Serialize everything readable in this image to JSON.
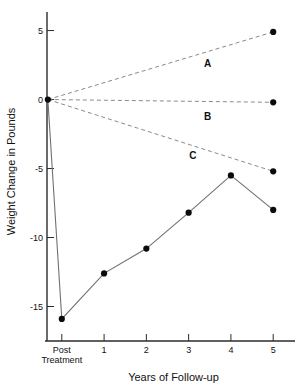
{
  "chart_data": {
    "type": "line",
    "title": "",
    "xlabel": "Years of Follow-up",
    "ylabel": "Weight Change in Pounds",
    "x": [
      0,
      1,
      2,
      3,
      4,
      5
    ],
    "xtick_labels": [
      "Post Treatment",
      "1",
      "2",
      "3",
      "4",
      "5"
    ],
    "xtick_label_lines": [
      [
        "Post",
        "Treatment"
      ],
      [
        "1"
      ],
      [
        "2"
      ],
      [
        "3"
      ],
      [
        "4"
      ],
      [
        "5"
      ]
    ],
    "ytick_labels": [
      "5",
      "0",
      "-5",
      "-10",
      "-15"
    ],
    "ytick_values": [
      5,
      0,
      -5,
      -10,
      -15
    ],
    "ylim": [
      -17.5,
      6.2
    ],
    "xlim": [
      -0.35,
      5.35
    ],
    "grid": false,
    "legend_position": "inline-annotations",
    "series": [
      {
        "name": "Treatment group",
        "label": "",
        "style": "solid",
        "color": "#6f6f6f",
        "markers": true,
        "x": [
          0,
          1,
          2,
          3,
          4,
          5
        ],
        "values": [
          -15.9,
          -12.6,
          -10.8,
          -8.2,
          -5.5,
          -8.0
        ],
        "leader_from": {
          "x": -0.33,
          "y": 0.0
        }
      },
      {
        "name": "A",
        "label": "A",
        "style": "dashed",
        "color": "#8a8a8a",
        "markers": true,
        "x": [
          -0.33,
          5
        ],
        "values": [
          0.0,
          4.9
        ],
        "label_x": 3.45,
        "label_y": 2.35
      },
      {
        "name": "B",
        "label": "B",
        "style": "dashed",
        "color": "#8a8a8a",
        "markers": true,
        "x": [
          -0.33,
          5
        ],
        "values": [
          0.0,
          -0.2
        ],
        "label_x": 3.45,
        "label_y": -1.45
      },
      {
        "name": "C",
        "label": "C",
        "style": "dashed",
        "color": "#8a8a8a",
        "markers": true,
        "x": [
          -0.33,
          5
        ],
        "values": [
          0.0,
          -5.2
        ],
        "label_x": 3.1,
        "label_y": -4.3
      }
    ],
    "origin_marker": {
      "x": -0.33,
      "y": 0.0
    }
  },
  "colors": {
    "axis": "#2b2b2b",
    "solid_series": "#6f6f6f",
    "dashed_series": "#8a8a8a",
    "marker": "#0b0b0b",
    "text": "#111111",
    "background": "#ffffff"
  }
}
